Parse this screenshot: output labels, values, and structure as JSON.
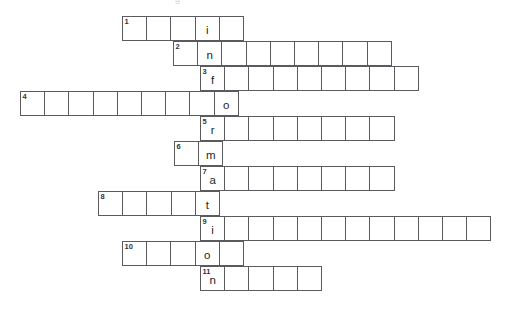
{
  "page": {
    "title_artifact": "g",
    "background_color": "#ffffff",
    "grid_line_color": "#5a5a5f",
    "text_color": "#1f1f24",
    "number_color": "#33333a"
  },
  "puzzle": {
    "type": "crossword",
    "orientation": "across-rows-with-vertical-spine",
    "spine_word": "information",
    "spine_column_x": 200,
    "cell_size": 25.2,
    "clue_count": 11,
    "rows": [
      {
        "number": "1",
        "left": 122,
        "top": 16,
        "cells": 5,
        "spine_index": 3,
        "spine_letter": "i"
      },
      {
        "number": "2",
        "left": 173,
        "top": 41,
        "cells": 9,
        "spine_index": 1,
        "spine_letter": "n"
      },
      {
        "number": "3",
        "left": 200,
        "top": 66,
        "cells": 9,
        "spine_index": 0,
        "spine_letter": "f"
      },
      {
        "number": "4",
        "left": 20,
        "top": 91,
        "cells": 9,
        "spine_index": 8,
        "spine_letter": "o"
      },
      {
        "number": "5",
        "left": 200,
        "top": 116,
        "cells": 8,
        "spine_index": 0,
        "spine_letter": "r"
      },
      {
        "number": "6",
        "left": 174,
        "top": 141,
        "cells": 2,
        "spine_index": 1,
        "spine_letter": "m"
      },
      {
        "number": "7",
        "left": 200,
        "top": 166,
        "cells": 8,
        "spine_index": 0,
        "spine_letter": "a"
      },
      {
        "number": "8",
        "left": 98,
        "top": 191,
        "cells": 5,
        "spine_index": 4,
        "spine_letter": "t"
      },
      {
        "number": "9",
        "left": 200,
        "top": 216,
        "cells": 12,
        "spine_index": 0,
        "spine_letter": "i"
      },
      {
        "number": "10",
        "left": 122,
        "top": 241,
        "cells": 5,
        "spine_index": 3,
        "spine_letter": "o"
      },
      {
        "number": "11",
        "left": 200,
        "top": 266,
        "cells": 5,
        "spine_index": 0,
        "spine_letter": "n"
      }
    ]
  }
}
